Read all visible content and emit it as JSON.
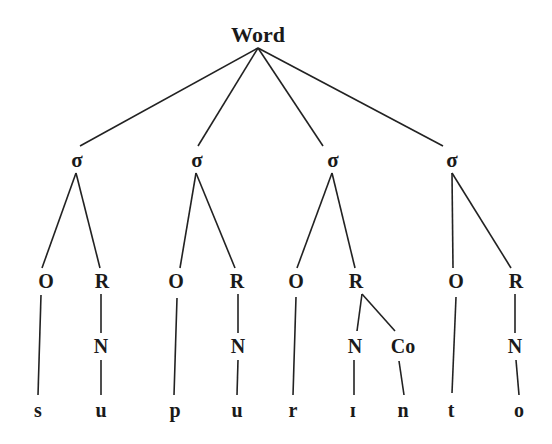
{
  "diagram": {
    "type": "syllable-structure-tree",
    "root": {
      "id": "word",
      "label": "Word",
      "x": 258,
      "y": 35
    },
    "nodes": [
      {
        "id": "s1",
        "label": "σ",
        "x": 77,
        "y": 160,
        "cls": "syl"
      },
      {
        "id": "s2",
        "label": "σ",
        "x": 197,
        "y": 160,
        "cls": "syl"
      },
      {
        "id": "s3",
        "label": "σ",
        "x": 333,
        "y": 160,
        "cls": "syl"
      },
      {
        "id": "s4",
        "label": "σ",
        "x": 452,
        "y": 160,
        "cls": "syl"
      },
      {
        "id": "o1",
        "label": "O",
        "x": 46,
        "y": 281,
        "cls": "node"
      },
      {
        "id": "r1",
        "label": "R",
        "x": 102,
        "y": 281,
        "cls": "node"
      },
      {
        "id": "o2",
        "label": "O",
        "x": 176,
        "y": 281,
        "cls": "node"
      },
      {
        "id": "r2",
        "label": "R",
        "x": 237,
        "y": 281,
        "cls": "node"
      },
      {
        "id": "o3",
        "label": "O",
        "x": 296,
        "y": 281,
        "cls": "node"
      },
      {
        "id": "r3",
        "label": "R",
        "x": 356,
        "y": 281,
        "cls": "node"
      },
      {
        "id": "o4",
        "label": "O",
        "x": 456,
        "y": 281,
        "cls": "node"
      },
      {
        "id": "r4",
        "label": "R",
        "x": 516,
        "y": 281,
        "cls": "node"
      },
      {
        "id": "n1",
        "label": "N",
        "x": 101,
        "y": 346,
        "cls": "node"
      },
      {
        "id": "n2",
        "label": "N",
        "x": 238,
        "y": 346,
        "cls": "node"
      },
      {
        "id": "n3",
        "label": "N",
        "x": 355,
        "y": 346,
        "cls": "node"
      },
      {
        "id": "co3",
        "label": "Co",
        "x": 403,
        "y": 346,
        "cls": "node"
      },
      {
        "id": "n4",
        "label": "N",
        "x": 515,
        "y": 346,
        "cls": "node"
      },
      {
        "id": "l1",
        "label": "s",
        "x": 38,
        "y": 410,
        "cls": "leaf"
      },
      {
        "id": "l2",
        "label": "u",
        "x": 101,
        "y": 410,
        "cls": "leaf"
      },
      {
        "id": "l3",
        "label": "p",
        "x": 175,
        "y": 410,
        "cls": "leaf"
      },
      {
        "id": "l4",
        "label": "u",
        "x": 237,
        "y": 410,
        "cls": "leaf"
      },
      {
        "id": "l5",
        "label": "r",
        "x": 293,
        "y": 410,
        "cls": "leaf"
      },
      {
        "id": "l6",
        "label": "ɪ",
        "x": 353,
        "y": 410,
        "cls": "leaf"
      },
      {
        "id": "l7",
        "label": "n",
        "x": 403,
        "y": 410,
        "cls": "leaf"
      },
      {
        "id": "l8",
        "label": "t",
        "x": 451,
        "y": 410,
        "cls": "leaf"
      },
      {
        "id": "l9",
        "label": "o",
        "x": 519,
        "y": 410,
        "cls": "leaf"
      }
    ],
    "edges": [
      {
        "from": [
          258,
          48
        ],
        "to": [
          80,
          146
        ]
      },
      {
        "from": [
          258,
          48
        ],
        "to": [
          198,
          146
        ]
      },
      {
        "from": [
          258,
          48
        ],
        "to": [
          323,
          146
        ]
      },
      {
        "from": [
          258,
          48
        ],
        "to": [
          443,
          146
        ]
      },
      {
        "from": [
          76,
          173
        ],
        "to": [
          42,
          268
        ]
      },
      {
        "from": [
          76,
          173
        ],
        "to": [
          100,
          268
        ]
      },
      {
        "from": [
          196,
          173
        ],
        "to": [
          180,
          268
        ]
      },
      {
        "from": [
          196,
          173
        ],
        "to": [
          235,
          268
        ]
      },
      {
        "from": [
          332,
          173
        ],
        "to": [
          297,
          268
        ]
      },
      {
        "from": [
          332,
          173
        ],
        "to": [
          355,
          268
        ]
      },
      {
        "from": [
          452,
          173
        ],
        "to": [
          453,
          268
        ]
      },
      {
        "from": [
          452,
          173
        ],
        "to": [
          511,
          268
        ]
      },
      {
        "from": [
          101,
          294
        ],
        "to": [
          101,
          333
        ]
      },
      {
        "from": [
          238,
          294
        ],
        "to": [
          238,
          333
        ]
      },
      {
        "from": [
          362,
          294
        ],
        "to": [
          357,
          331
        ]
      },
      {
        "from": [
          362,
          294
        ],
        "to": [
          395,
          331
        ]
      },
      {
        "from": [
          515,
          294
        ],
        "to": [
          515,
          333
        ]
      },
      {
        "from": [
          41,
          295
        ],
        "to": [
          38,
          395
        ]
      },
      {
        "from": [
          101,
          360
        ],
        "to": [
          101,
          395
        ]
      },
      {
        "from": [
          177,
          298
        ],
        "to": [
          174,
          395
        ]
      },
      {
        "from": [
          238,
          360
        ],
        "to": [
          237,
          395
        ]
      },
      {
        "from": [
          296,
          297
        ],
        "to": [
          293,
          395
        ]
      },
      {
        "from": [
          354,
          360
        ],
        "to": [
          354,
          395
        ]
      },
      {
        "from": [
          399,
          361
        ],
        "to": [
          404,
          395
        ]
      },
      {
        "from": [
          456,
          297
        ],
        "to": [
          452,
          393
        ]
      },
      {
        "from": [
          516,
          360
        ],
        "to": [
          519,
          395
        ]
      }
    ]
  }
}
